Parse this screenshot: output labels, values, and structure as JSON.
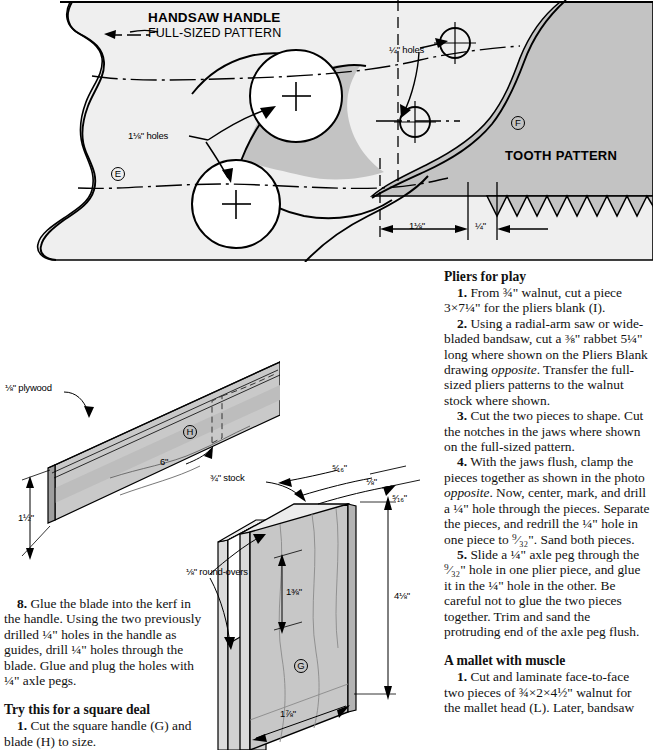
{
  "pattern_drawing": {
    "title": "HANDSAW HANDLE",
    "subtitle": "FULL-SIZED PATTERN",
    "tooth_title": "TOOTH PATTERN",
    "labels": {
      "quarter_holes": "¼\" holes",
      "one_eighth_holes": "1⅛\" holes",
      "dim_one_eighth": "1⅛\"",
      "dim_quarter": "¼\""
    },
    "part_e": "E",
    "part_f": "F",
    "fill_color": "#c9c9c9",
    "background_color": "#efefef"
  },
  "blade_drawing": {
    "part": "H",
    "labels": {
      "plywood": "⅛\" plywood",
      "height": "1½\"",
      "length": "6\""
    }
  },
  "handle_drawing": {
    "part": "G",
    "labels": {
      "stock": "¾\" stock",
      "roundovers": "⅛\" round-overs",
      "kerf_top": "⁵⁄₁₆\"",
      "kerf_mid": "⅛\"",
      "kerf_bottom": "⁵⁄₁₆\"",
      "depth": "1⅜\"",
      "height": "4⅛\"",
      "width": "1⅞\""
    }
  },
  "left_text": {
    "step8": {
      "num": "8.",
      "body": " Glue the blade into the kerf in the handle. Using the two previously drilled ¼\" holes in the handle as guides, drill ¼\" holes through the blade. Glue and plug the holes with ¼\" axle pegs."
    },
    "heading": "Try this for a square deal",
    "step1": {
      "num": "1.",
      "body": " Cut the square handle (G) and blade (H) to size."
    },
    "step2": {
      "num": "2.",
      "body": " Cut the kerf in the handle as"
    }
  },
  "right_text": {
    "heading_pliers": "Pliers for play",
    "p1": {
      "num": "1.",
      "body": " From ¾\" walnut, cut a piece 3×7¼\" for the pliers blank (I)."
    },
    "p2": {
      "num": "2.",
      "body_pre": " Using a radial-arm saw or wide-bladed bandsaw, cut a ⅜\" rabbet 5¼\" long where shown on the Pliers Blank drawing ",
      "body_ital": "opposite",
      "body_post": ". Transfer the full-sized pliers patterns to the walnut stock where shown."
    },
    "p3": {
      "num": "3.",
      "body": " Cut the two pieces to shape. Cut the notches in the jaws where shown on the full-sized pattern."
    },
    "p4": {
      "num": "4.",
      "body_pre": " With the jaws flush, clamp the pieces together as shown in the photo ",
      "body_ital": "opposite",
      "body_post": ". Now, center, mark, and drill a ¼\" hole through the pieces. Separate the pieces, and redrill the ¼\" hole in one piece to ⁹⁄₃₂\". Sand both pieces."
    },
    "p5": {
      "num": "5.",
      "body": " Slide a ¼\" axle peg through the ⁹⁄₃₂\" hole in one plier piece, and glue it in the ¼\" hole in the other. Be careful not to glue the two pieces together. Trim and sand the protruding end of the axle peg flush."
    },
    "heading_mallet": "A mallet with muscle",
    "m1": {
      "num": "1.",
      "body": " Cut and laminate face-to-face two pieces of ¾×2×4½\" walnut for the mallet head (L). Later, bandsaw"
    }
  }
}
